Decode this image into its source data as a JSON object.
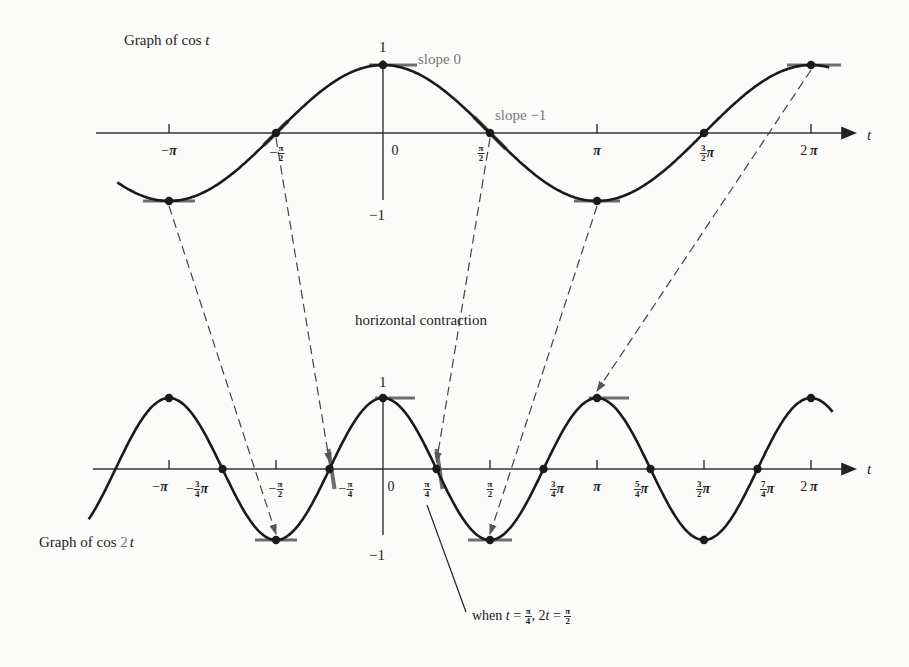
{
  "top_graph": {
    "title_prefix": "Graph of cos ",
    "title_var": "t",
    "axis_var": "t",
    "y_labels": {
      "one": "1",
      "minus_one": "−1"
    },
    "annotations": {
      "slope0": "slope 0",
      "slope_minus1": "slope −1"
    },
    "ticks": [
      {
        "id": "neg-pi",
        "pre": "−",
        "num": "",
        "den": "",
        "post": "π",
        "x": 169
      },
      {
        "id": "neg-half-pi",
        "pre": "−",
        "num": "π",
        "den": "2",
        "post": "",
        "x": 277
      },
      {
        "id": "zero",
        "pre": "0",
        "num": "",
        "den": "",
        "post": "",
        "x": 395
      },
      {
        "id": "half-pi",
        "pre": "",
        "num": "π",
        "den": "2",
        "post": "",
        "x": 481
      },
      {
        "id": "pi",
        "pre": "",
        "num": "",
        "den": "",
        "post": "π",
        "x": 597
      },
      {
        "id": "three-half-pi",
        "pre": "",
        "num": "3",
        "den": "2",
        "post": "π",
        "x": 707
      },
      {
        "id": "two-pi",
        "pre": "2 ",
        "num": "",
        "den": "",
        "post": "π",
        "x": 809
      }
    ]
  },
  "bottom_graph": {
    "title_prefix": "Graph of cos ",
    "title_coef": "2",
    "title_var": "t",
    "axis_var": "t",
    "y_labels": {
      "one": "1",
      "minus_one": "−1"
    },
    "ticks": [
      {
        "id": "neg-pi",
        "pre": "−",
        "num": "",
        "den": "",
        "post": "π",
        "x": 160
      },
      {
        "id": "neg-three-quarter-pi",
        "pre": "−",
        "num": "3",
        "den": "4",
        "post": "π",
        "x": 197
      },
      {
        "id": "neg-half-pi",
        "pre": "−",
        "num": "π",
        "den": "2",
        "post": "",
        "x": 276
      },
      {
        "id": "neg-quarter-pi",
        "pre": "−",
        "num": "π",
        "den": "4",
        "post": "",
        "x": 346
      },
      {
        "id": "zero",
        "pre": "0",
        "num": "",
        "den": "",
        "post": "",
        "x": 391
      },
      {
        "id": "quarter-pi",
        "pre": "",
        "num": "π",
        "den": "4",
        "post": "",
        "x": 427
      },
      {
        "id": "half-pi",
        "pre": "",
        "num": "π",
        "den": "2",
        "post": "",
        "x": 490
      },
      {
        "id": "three-quarter-pi",
        "pre": "",
        "num": "3",
        "den": "4",
        "post": "π",
        "x": 557
      },
      {
        "id": "pi",
        "pre": "",
        "num": "",
        "den": "",
        "post": "π",
        "x": 597
      },
      {
        "id": "five-quarter-pi",
        "pre": "",
        "num": "5",
        "den": "4",
        "post": "π",
        "x": 641
      },
      {
        "id": "three-half-pi",
        "pre": "",
        "num": "3",
        "den": "2",
        "post": "π",
        "x": 703
      },
      {
        "id": "seven-quarter-pi",
        "pre": "",
        "num": "7",
        "den": "4",
        "post": "π",
        "x": 767
      },
      {
        "id": "two-pi",
        "pre": "2 ",
        "num": "",
        "den": "",
        "post": "π",
        "x": 809
      }
    ]
  },
  "middle_label": "horizontal contraction",
  "note": {
    "prefix": "when ",
    "t": "t",
    "eq1": " = ",
    "num1": "π",
    "den1": "4",
    "mid": ", 2",
    "t2": "t",
    "eq2": " = ",
    "num2": "π",
    "den2": "2"
  },
  "colors": {
    "curve": "#1a1a1a",
    "axis": "#333333",
    "tangent": "#6e6e6e",
    "dash": "#444444",
    "label_gray": "#777777"
  },
  "chart_data": {
    "type": "line",
    "series": [
      {
        "name": "cos t",
        "x_range": [
          -3.9,
          6.6
        ],
        "marked_points": [
          [
            -3.1416,
            -1
          ],
          [
            -1.5708,
            0
          ],
          [
            0,
            1
          ],
          [
            1.5708,
            0
          ],
          [
            3.1416,
            -1
          ],
          [
            4.7124,
            0
          ],
          [
            6.2832,
            1
          ]
        ]
      },
      {
        "name": "cos 2t",
        "x_range": [
          -3.9,
          6.6
        ],
        "marked_points": [
          [
            -3.1416,
            1
          ],
          [
            -2.3562,
            0
          ],
          [
            -1.5708,
            -1
          ],
          [
            -0.7854,
            0
          ],
          [
            0,
            1
          ],
          [
            0.7854,
            0
          ],
          [
            1.5708,
            -1
          ],
          [
            2.3562,
            0
          ],
          [
            3.1416,
            1
          ],
          [
            3.927,
            0
          ],
          [
            4.7124,
            -1
          ],
          [
            5.4978,
            0
          ],
          [
            6.2832,
            1
          ]
        ]
      }
    ],
    "xlabel": "t",
    "ylim": [
      -1,
      1
    ],
    "mappings": [
      [
        -3.1416,
        -1.5708
      ],
      [
        -1.5708,
        -0.7854
      ],
      [
        1.5708,
        0.7854
      ],
      [
        3.1416,
        1.5708
      ],
      [
        6.2832,
        3.1416
      ]
    ]
  }
}
